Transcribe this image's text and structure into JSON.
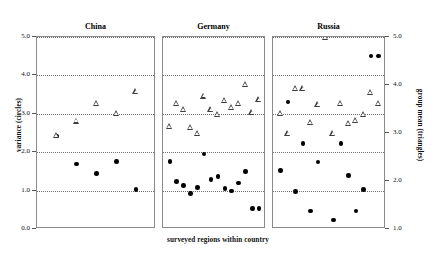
{
  "chart_data": {
    "type": "scatter",
    "title": "",
    "xlabel": "surveyed regions within country",
    "ylabel_left": "variance (circles)",
    "ylabel_right": "group mean (triangles)",
    "ylim_left": [
      0.0,
      5.0
    ],
    "ylim_right": [
      1.0,
      5.0
    ],
    "yticks_left": [
      "0.0",
      "1.0",
      "2.0",
      "3.0",
      "4.0",
      "5.0"
    ],
    "yticks_right": [
      "1.0",
      "2.0",
      "3.0",
      "4.0",
      "5.0"
    ],
    "xticks": [],
    "grid": true,
    "legend": "none",
    "panel_labels": [
      "China",
      "Germany",
      "Russia"
    ],
    "panels": [
      {
        "label": "China",
        "n": 5,
        "series": [
          {
            "name": "variance (circles)",
            "axis": "left",
            "marker": "filled-circle",
            "x": [
              1,
              2,
              3,
              4,
              5
            ],
            "values": [
              2.42,
              1.69,
              1.44,
              1.76,
              1.03
            ]
          },
          {
            "name": "group mean (triangles)",
            "axis": "right",
            "marker": "open-triangle",
            "x": [
              1,
              2,
              3,
              4,
              5
            ],
            "values": [
              2.96,
              3.26,
              3.62,
              3.42,
              3.88
            ]
          }
        ]
      },
      {
        "label": "Germany",
        "n": 14,
        "series": [
          {
            "name": "variance (circles)",
            "axis": "left",
            "marker": "filled-circle",
            "x": [
              1,
              2,
              3,
              4,
              5,
              6,
              7,
              8,
              9,
              10,
              11,
              12,
              13,
              14
            ],
            "values": [
              1.76,
              1.23,
              1.13,
              0.93,
              1.08,
              1.95,
              1.29,
              1.37,
              1.06,
              0.99,
              1.2,
              1.5,
              0.54,
              0.54
            ]
          },
          {
            "name": "group mean (triangles)",
            "axis": "right",
            "marker": "open-triangle",
            "x": [
              1,
              2,
              3,
              4,
              5,
              6,
              7,
              8,
              9,
              10,
              11,
              12,
              13,
              14
            ],
            "values": [
              3.15,
              3.62,
              3.5,
              3.12,
              3.0,
              3.78,
              3.5,
              3.4,
              3.68,
              3.54,
              3.63,
              4.02,
              3.44,
              3.7
            ]
          }
        ]
      },
      {
        "label": "Russia",
        "n": 14,
        "series": [
          {
            "name": "variance (circles)",
            "axis": "left",
            "marker": "filled-circle",
            "x": [
              1,
              2,
              3,
              4,
              5,
              6,
              7,
              8,
              9,
              10,
              11,
              12,
              13,
              14
            ],
            "values": [
              1.52,
              3.31,
              0.98,
              2.23,
              0.47,
              1.74,
              0.0,
              0.23,
              2.23,
              1.4,
              0.47,
              1.03,
              4.5,
              4.5
            ]
          },
          {
            "name": "group mean (triangles)",
            "axis": "right",
            "marker": "open-triangle",
            "x": [
              1,
              2,
              3,
              4,
              5,
              6,
              7,
              8,
              9,
              10,
              11,
              12,
              13,
              14
            ],
            "values": [
              3.42,
              3.0,
              3.93,
              3.93,
              3.22,
              3.6,
              5.0,
              3.0,
              3.62,
              3.2,
              3.27,
              3.4,
              3.86,
              3.62
            ]
          }
        ]
      }
    ]
  },
  "axes": {
    "left": {
      "title": "variance (circles)",
      "ticks": [
        {
          "label": "5.0",
          "value": 5.0
        },
        {
          "label": "4.0",
          "value": 4.0
        },
        {
          "label": "3.0",
          "value": 3.0
        },
        {
          "label": "2.0",
          "value": 2.0
        },
        {
          "label": "1.0",
          "value": 1.0
        },
        {
          "label": "0.0",
          "value": 0.0
        }
      ]
    },
    "right": {
      "title": "group mean (triangles)",
      "ticks": [
        {
          "label": "5.0",
          "value": 5.0
        },
        {
          "label": "4.0",
          "value": 4.0
        },
        {
          "label": "3.0",
          "value": 3.0
        },
        {
          "label": "2.0",
          "value": 2.0
        },
        {
          "label": "1.0",
          "value": 1.0
        }
      ]
    },
    "x": {
      "title": "surveyed regions within country"
    }
  },
  "style": {
    "marker_circle_color": "#000000",
    "marker_triangle_color": "#3d3d3d",
    "gridline_color": "#6d6d6d",
    "frame_color": "#8a8a8a",
    "background": "#ffffff"
  }
}
